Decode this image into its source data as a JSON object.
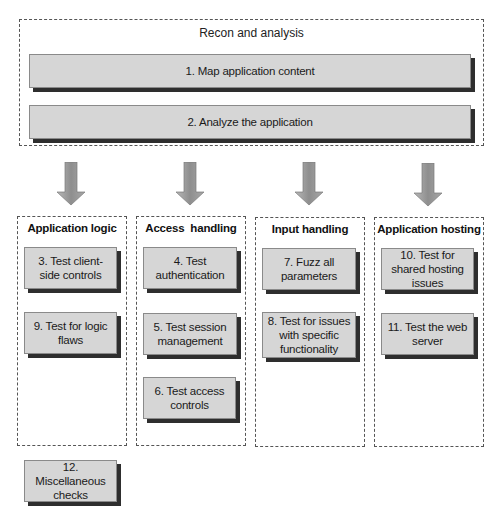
{
  "diagram": {
    "recon": {
      "title": "Recon and analysis",
      "steps": [
        {
          "label": "1. Map application content"
        },
        {
          "label": "2. Analyze the application"
        }
      ]
    },
    "columns": [
      {
        "title": "Application logic",
        "steps": [
          {
            "label": "3. Test client-side controls"
          },
          {
            "label": "9. Test for logic flaws"
          }
        ]
      },
      {
        "title": "Access  handling",
        "steps": [
          {
            "label": "4. Test authentication"
          },
          {
            "label": "5. Test session management"
          },
          {
            "label": "6. Test access controls"
          }
        ]
      },
      {
        "title": "Input handling",
        "steps": [
          {
            "label": "7. Fuzz all parameters"
          },
          {
            "label": "8. Test for issues with specific functionality"
          }
        ]
      },
      {
        "title": "Application hosting",
        "steps": [
          {
            "label": "10. Test for shared hosting issues"
          },
          {
            "label": "11. Test the web server"
          }
        ]
      }
    ],
    "misc": {
      "label": "12. Miscellaneous checks"
    },
    "colors": {
      "box_fill": "#d6d6d6",
      "box_shadow": "#2e2e2e",
      "arrow": "#9a9a9a",
      "dashed_border": "#555555"
    }
  }
}
